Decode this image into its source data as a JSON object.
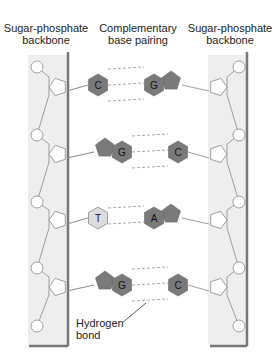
{
  "labels": {
    "left_backbone": [
      "Sugar-phosphate",
      "backbone"
    ],
    "center": [
      "Complementary",
      "base pairing"
    ],
    "right_backbone": [
      "Sugar-phosphate",
      "backbone"
    ],
    "hydrogen_bond": [
      "Hydrogen",
      "bond"
    ]
  },
  "pairs": [
    {
      "left": "C",
      "right": "G",
      "left_shape": "pyrimidine",
      "right_shape": "purine",
      "bonds": 3
    },
    {
      "left": "G",
      "right": "C",
      "left_shape": "purine",
      "right_shape": "pyrimidine",
      "bonds": 3
    },
    {
      "left": "T",
      "right": "A",
      "left_shape": "pyrimidine",
      "right_shape": "purine",
      "bonds": 2
    },
    {
      "left": "G",
      "right": "C",
      "left_shape": "purine",
      "right_shape": "pyrimidine",
      "bonds": 3
    }
  ],
  "colors": {
    "backbone_fill": "#eeeeee",
    "backbone_bar": "#777777",
    "base_dark": "#7a7a7a",
    "base_light": "#dcdcdc",
    "line": "#888888",
    "dashed": "#aaaaaa"
  }
}
